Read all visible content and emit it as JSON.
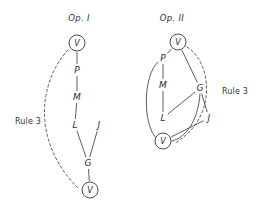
{
  "figure": {
    "background_color": "#ffffff",
    "ink_color": "#4a4a4a",
    "width": 262,
    "height": 209
  },
  "panels": [
    {
      "id": "op-1",
      "caption": "Op. I",
      "caption_pos": {
        "x": 79,
        "y": 18
      },
      "nodes": [
        {
          "id": "v-top",
          "label": "V",
          "x": 77,
          "y": 43,
          "circled": true
        },
        {
          "id": "p",
          "label": "P",
          "x": 77,
          "y": 70,
          "circled": false
        },
        {
          "id": "m",
          "label": "M",
          "x": 77,
          "y": 97,
          "circled": false
        },
        {
          "id": "l",
          "label": "L",
          "x": 75,
          "y": 125,
          "circled": false
        },
        {
          "id": "j",
          "label": "J",
          "x": 99,
          "y": 125,
          "circled": false
        },
        {
          "id": "g",
          "label": "G",
          "x": 88,
          "y": 163,
          "circled": false
        },
        {
          "id": "v-bottom",
          "label": "V",
          "x": 90,
          "y": 190,
          "circled": true
        }
      ],
      "edges": [
        {
          "from": "v-top",
          "to": "p",
          "style": "solid"
        },
        {
          "from": "p",
          "to": "m",
          "style": "solid"
        },
        {
          "from": "m",
          "to": "l",
          "style": "solid"
        },
        {
          "from": "l",
          "to": "g",
          "style": "solid"
        },
        {
          "from": "j",
          "to": "g",
          "style": "solid"
        },
        {
          "from": "g",
          "to": "v-bottom",
          "style": "solid"
        }
      ],
      "rule_arc": {
        "label": "Rule 3",
        "label_pos": {
          "x": 28,
          "y": 122
        },
        "style": "dashed",
        "path": "M 68 50 C 40 80, 30 140, 78 188"
      }
    },
    {
      "id": "op-2",
      "caption": "Op. II",
      "caption_pos": {
        "x": 172,
        "y": 18
      },
      "nodes": [
        {
          "id": "v-top",
          "label": "V",
          "x": 178,
          "y": 42,
          "circled": true
        },
        {
          "id": "p",
          "label": "P",
          "x": 163,
          "y": 58,
          "circled": false
        },
        {
          "id": "m",
          "label": "M",
          "x": 163,
          "y": 85,
          "circled": false
        },
        {
          "id": "l",
          "label": "L",
          "x": 163,
          "y": 118,
          "circled": false
        },
        {
          "id": "g",
          "label": "G",
          "x": 200,
          "y": 88,
          "circled": false
        },
        {
          "id": "j",
          "label": "J",
          "x": 209,
          "y": 118,
          "circled": false
        },
        {
          "id": "v-bottom",
          "label": "V",
          "x": 163,
          "y": 141,
          "circled": true
        }
      ],
      "edges": [
        {
          "from": "v-top",
          "to": "p",
          "style": "solid"
        },
        {
          "from": "v-top",
          "to": "g",
          "style": "solid"
        },
        {
          "from": "p",
          "to": "m",
          "style": "solid"
        },
        {
          "from": "m",
          "to": "l",
          "style": "solid"
        },
        {
          "from": "g",
          "to": "l",
          "style": "solid"
        },
        {
          "from": "g",
          "to": "j",
          "style": "solid"
        },
        {
          "from": "j",
          "to": "v-bottom",
          "style": "solid"
        }
      ],
      "curved_edges": [
        {
          "from": "p",
          "to": "v-bottom",
          "style": "solid",
          "path": "M 158 62 C 143 75, 142 125, 157 139"
        },
        {
          "from": "g",
          "to": "v-bottom",
          "style": "solid",
          "path": "M 200 94 C 198 122, 185 138, 172 141"
        }
      ],
      "rule_arc": {
        "label": "Rule 3",
        "label_pos": {
          "x": 235,
          "y": 92
        },
        "style": "dashed",
        "path": "M 187 47 C 212 62, 218 118, 175 143"
      }
    }
  ]
}
